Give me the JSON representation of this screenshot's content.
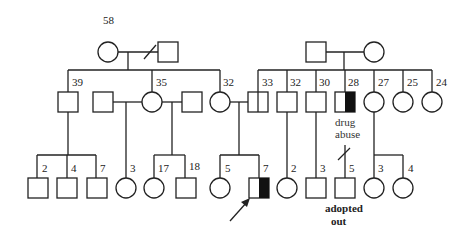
{
  "colors": {
    "line": "#222222",
    "affected": "#111111",
    "background": "#ffffff"
  },
  "generation1": {
    "left_couple": {
      "female_age": "58",
      "relationship": "divorced"
    },
    "right_couple": {}
  },
  "generation2": {
    "left_siblings": [
      {
        "sex": "male",
        "age": "39"
      },
      {
        "sex": "female",
        "age": "35"
      },
      {
        "sex": "female",
        "age": "32"
      }
    ],
    "right_siblings": [
      {
        "sex": "male",
        "age": "33",
        "status": "carrier-split"
      },
      {
        "sex": "male",
        "age": "32"
      },
      {
        "sex": "male",
        "age": "30"
      },
      {
        "sex": "male",
        "age": "28",
        "status": "half-affected",
        "note": [
          "drug",
          "abuse"
        ]
      },
      {
        "sex": "female",
        "age": "27"
      },
      {
        "sex": "female",
        "age": "25"
      },
      {
        "sex": "female",
        "age": "24"
      }
    ]
  },
  "generation3": [
    {
      "sex": "male",
      "age": "2"
    },
    {
      "sex": "male",
      "age": "4"
    },
    {
      "sex": "male",
      "age": "7"
    },
    {
      "sex": "female",
      "age": "3"
    },
    {
      "sex": "female",
      "age": "17"
    },
    {
      "sex": "male",
      "age": "18"
    },
    {
      "sex": "female",
      "age": "5"
    },
    {
      "sex": "male",
      "age": "7",
      "status": "proband-half-affected"
    },
    {
      "sex": "female",
      "age": "2"
    },
    {
      "sex": "male",
      "age": "3"
    },
    {
      "sex": "male",
      "age": "5",
      "note": [
        "adopted",
        "out"
      ]
    },
    {
      "sex": "female",
      "age": "3"
    },
    {
      "sex": "female",
      "age": "4"
    }
  ]
}
